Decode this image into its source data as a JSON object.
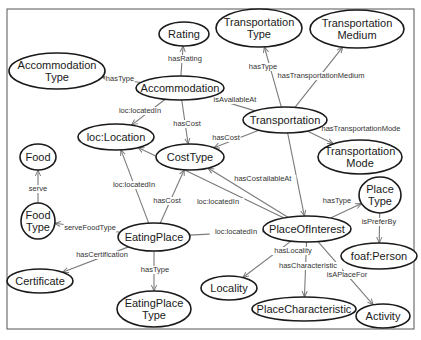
{
  "diagram": {
    "type": "ontology-graph",
    "frame": {
      "x": 7,
      "y": 9,
      "w": 407,
      "h": 320
    },
    "colors": {
      "node_stroke": "#1a1a1a",
      "edge": "#7a7a7a",
      "text": "#1a1a1a",
      "background": "#ffffff"
    },
    "nodes": [
      {
        "id": "rating",
        "lines": [
          "Rating"
        ],
        "cx": 184,
        "cy": 34,
        "rx": 25,
        "ry": 12
      },
      {
        "id": "accommodation_type",
        "lines": [
          "Accommodation",
          "Type"
        ],
        "cx": 57,
        "cy": 71,
        "rx": 48,
        "ry": 18
      },
      {
        "id": "accommodation",
        "lines": [
          "Accommodation"
        ],
        "cx": 180,
        "cy": 88,
        "rx": 44,
        "ry": 12
      },
      {
        "id": "transportation_type",
        "lines": [
          "Transportation",
          "Type"
        ],
        "cx": 259,
        "cy": 28,
        "rx": 43,
        "ry": 19
      },
      {
        "id": "transportation_medium",
        "lines": [
          "Transportation",
          "Medium"
        ],
        "cx": 357,
        "cy": 29,
        "rx": 47,
        "ry": 19
      },
      {
        "id": "transportation",
        "lines": [
          "Transportation"
        ],
        "cx": 285,
        "cy": 120,
        "rx": 42,
        "ry": 13
      },
      {
        "id": "transportation_mode",
        "lines": [
          "Transportation",
          "Mode"
        ],
        "cx": 360,
        "cy": 157,
        "rx": 42,
        "ry": 17
      },
      {
        "id": "loc_location",
        "lines": [
          "loc:Location"
        ],
        "cx": 116,
        "cy": 137,
        "rx": 38,
        "ry": 13
      },
      {
        "id": "cost_type",
        "lines": [
          "CostType"
        ],
        "cx": 190,
        "cy": 157,
        "rx": 34,
        "ry": 13
      },
      {
        "id": "food",
        "lines": [
          "Food"
        ],
        "cx": 38,
        "cy": 157,
        "rx": 18,
        "ry": 13
      },
      {
        "id": "food_type",
        "lines": [
          "Food",
          "Type"
        ],
        "cx": 38,
        "cy": 221,
        "rx": 17,
        "ry": 18
      },
      {
        "id": "eating_place",
        "lines": [
          "EatingPlace"
        ],
        "cx": 154,
        "cy": 237,
        "rx": 36,
        "ry": 14
      },
      {
        "id": "certificate",
        "lines": [
          "Certificate"
        ],
        "cx": 40,
        "cy": 281,
        "rx": 33,
        "ry": 12
      },
      {
        "id": "eating_place_type",
        "lines": [
          "EatingPlace",
          "Type"
        ],
        "cx": 154,
        "cy": 309,
        "rx": 37,
        "ry": 18
      },
      {
        "id": "place_of_interest",
        "lines": [
          "PlaceOfInterest"
        ],
        "cx": 307,
        "cy": 229,
        "rx": 44,
        "ry": 13
      },
      {
        "id": "place_type",
        "lines": [
          "Place",
          "Type"
        ],
        "cx": 380,
        "cy": 195,
        "rx": 21,
        "ry": 18
      },
      {
        "id": "foaf_person",
        "lines": [
          "foaf:Person"
        ],
        "cx": 379,
        "cy": 256,
        "rx": 38,
        "ry": 13
      },
      {
        "id": "locality",
        "lines": [
          "Locality"
        ],
        "cx": 229,
        "cy": 288,
        "rx": 28,
        "ry": 12
      },
      {
        "id": "place_characteristic",
        "lines": [
          "PlaceCharacteristic"
        ],
        "cx": 304,
        "cy": 309,
        "rx": 52,
        "ry": 12
      },
      {
        "id": "activity",
        "lines": [
          "Activity"
        ],
        "cx": 383,
        "cy": 316,
        "rx": 27,
        "ry": 12
      }
    ],
    "edges": [
      {
        "from": "accommodation",
        "to": "rating",
        "label": "hasRating",
        "lx": 185,
        "ly": 61
      },
      {
        "from": "accommodation",
        "to": "accommodation_type",
        "label": "hasType",
        "lx": 120,
        "ly": 81
      },
      {
        "from": "accommodation",
        "to": "loc_location",
        "label": "loc:locatedIn",
        "lx": 140,
        "ly": 113
      },
      {
        "from": "accommodation",
        "to": "cost_type",
        "label": "hasCost",
        "lx": 187,
        "ly": 126
      },
      {
        "from": "transportation",
        "to": "transportation_type",
        "label": "hasType",
        "lx": 263,
        "ly": 69
      },
      {
        "from": "transportation",
        "to": "transportation_medium",
        "label": "hasTransportationMedium",
        "lx": 321,
        "ly": 78
      },
      {
        "from": "transportation",
        "to": "accommodation",
        "label": "isAvailableAt",
        "lx": 235,
        "ly": 102
      },
      {
        "from": "transportation",
        "to": "transportation_mode",
        "label": "hasTransportationMode",
        "lx": 361,
        "ly": 131
      },
      {
        "from": "transportation",
        "to": "cost_type",
        "label": "hasCost",
        "lx": 226,
        "ly": 140
      },
      {
        "from": "transportation",
        "to": "place_of_interest",
        "label": "isAvailableAt",
        "lx": 270,
        "ly": 181
      },
      {
        "from": "food_type",
        "to": "food",
        "label": "serve",
        "lx": 38,
        "ly": 191
      },
      {
        "from": "eating_place",
        "to": "food_type",
        "label": "serveFoodType",
        "lx": 90,
        "ly": 230
      },
      {
        "from": "eating_place",
        "to": "loc_location",
        "label": "loc:locatedIn",
        "lx": 134,
        "ly": 187
      },
      {
        "from": "eating_place",
        "to": "cost_type",
        "label": "hasCost",
        "lx": 167,
        "ly": 203
      },
      {
        "from": "eating_place",
        "to": "certificate",
        "label": "hasCertification",
        "lx": 102,
        "ly": 257
      },
      {
        "from": "eating_place",
        "to": "eating_place_type",
        "label": "hasType",
        "lx": 155,
        "ly": 272
      },
      {
        "from": "eating_place",
        "to": "place_of_interest",
        "label": "loc:locatedIn",
        "lx": 236,
        "ly": 234
      },
      {
        "from": "place_of_interest",
        "to": "loc_location",
        "label": "loc:locatedIn",
        "lx": 218,
        "ly": 204
      },
      {
        "from": "place_of_interest",
        "to": "cost_type",
        "label": "hasCost",
        "lx": 248,
        "ly": 181
      },
      {
        "from": "place_of_interest",
        "to": "place_type",
        "label": "hasType",
        "lx": 337,
        "ly": 203
      },
      {
        "from": "place_type",
        "to": "foaf_person",
        "label": "isPreferBy",
        "lx": 379,
        "ly": 224
      },
      {
        "from": "place_of_interest",
        "to": "locality",
        "label": "hasLocality",
        "lx": 293,
        "ly": 253
      },
      {
        "from": "place_of_interest",
        "to": "place_characteristic",
        "label": "hasCharacteristic",
        "lx": 308,
        "ly": 268
      },
      {
        "from": "place_of_interest",
        "to": "activity",
        "label": "isAPlaceFor",
        "lx": 347,
        "ly": 277
      }
    ]
  }
}
